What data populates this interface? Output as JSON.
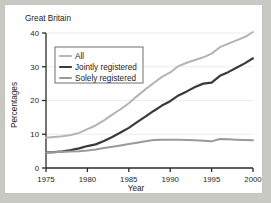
{
  "figure": {
    "region_title": "Great Britain",
    "background_color": "#ffffff",
    "page_background_color": "#c9c9c4",
    "border_color": "#c4c4c0"
  },
  "chart_data": {
    "type": "line",
    "title": "Great Britain",
    "xlabel": "Year",
    "ylabel": "Percentages",
    "xlim": [
      1975,
      2000
    ],
    "ylim": [
      0,
      40
    ],
    "xticks": [
      1975,
      1980,
      1985,
      1990,
      1995,
      2000
    ],
    "yticks": [
      0,
      10,
      20,
      30,
      40
    ],
    "xtick_labels": [
      "1975",
      "1980",
      "1985",
      "1990",
      "1995",
      "2000"
    ],
    "ytick_labels": [
      "0",
      "10",
      "20",
      "30",
      "40"
    ],
    "grid": true,
    "grid_axis": "y",
    "legend_position": "upper left",
    "x": [
      1975,
      1976,
      1977,
      1978,
      1979,
      1980,
      1981,
      1982,
      1983,
      1984,
      1985,
      1986,
      1987,
      1988,
      1989,
      1990,
      1991,
      1992,
      1993,
      1994,
      1995,
      1996,
      1997,
      1998,
      1999,
      2000
    ],
    "series": [
      {
        "name": "All",
        "color": "#b4b4b4",
        "width": 2.0,
        "values": [
          9.0,
          9.2,
          9.4,
          9.8,
          10.4,
          11.5,
          12.6,
          14.1,
          15.8,
          17.4,
          19.2,
          21.3,
          23.3,
          25.2,
          27.0,
          28.3,
          30.2,
          31.2,
          32.0,
          32.8,
          33.9,
          35.8,
          36.8,
          37.8,
          38.8,
          40.3
        ]
      },
      {
        "name": "Jointly registered",
        "color": "#3a3a3a",
        "width": 2.2,
        "values": [
          4.6,
          4.7,
          4.9,
          5.3,
          5.8,
          6.5,
          7.0,
          8.0,
          9.2,
          10.5,
          11.9,
          13.6,
          15.2,
          16.9,
          18.5,
          19.8,
          21.5,
          22.7,
          24.0,
          25.0,
          25.3,
          27.3,
          28.4,
          29.7,
          31.0,
          32.5
        ]
      },
      {
        "name": "Solely registered",
        "color": "#9a9a9a",
        "width": 2.0,
        "values": [
          4.6,
          4.7,
          4.8,
          4.9,
          5.0,
          5.2,
          5.5,
          5.9,
          6.3,
          6.7,
          7.1,
          7.5,
          7.9,
          8.3,
          8.4,
          8.4,
          8.4,
          8.3,
          8.2,
          8.1,
          7.9,
          8.6,
          8.5,
          8.4,
          8.3,
          8.2
        ]
      }
    ]
  },
  "legend": {
    "entries": [
      {
        "label": "All"
      },
      {
        "label": "Jointly registered"
      },
      {
        "label": "Solely registered"
      }
    ]
  }
}
